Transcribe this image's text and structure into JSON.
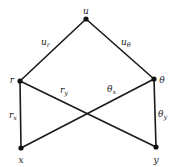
{
  "diagram": {
    "type": "dependency-tree",
    "nodes": [
      {
        "id": "u",
        "label": "u",
        "x": 86,
        "y": 19,
        "lx": 86,
        "ly": 11
      },
      {
        "id": "r",
        "label": "r",
        "x": 20,
        "y": 81,
        "lx": 12,
        "ly": 80
      },
      {
        "id": "theta",
        "label": "θ",
        "x": 154,
        "y": 79,
        "lx": 162,
        "ly": 80
      },
      {
        "id": "x",
        "label": "x",
        "x": 21,
        "y": 148,
        "lx": 21,
        "ly": 160
      },
      {
        "id": "y",
        "label": "y",
        "x": 156,
        "y": 147,
        "lx": 156,
        "ly": 160
      }
    ],
    "edges": [
      {
        "from": "u",
        "to": "r",
        "label_main": "u",
        "label_sub": "r",
        "lx": 41,
        "ly": 45
      },
      {
        "from": "u",
        "to": "theta",
        "label_main": "u",
        "label_sub": "θ",
        "lx": 121,
        "ly": 45
      },
      {
        "from": "r",
        "to": "x",
        "label_main": "r",
        "label_sub": "x",
        "lx": 9,
        "ly": 118
      },
      {
        "from": "r",
        "to": "y",
        "label_main": "r",
        "label_sub": "y",
        "lx": 60,
        "ly": 93
      },
      {
        "from": "theta",
        "to": "x",
        "label_main": "θ",
        "label_sub": "x",
        "lx": 107,
        "ly": 92
      },
      {
        "from": "theta",
        "to": "y",
        "label_main": "θ",
        "label_sub": "y",
        "lx": 158,
        "ly": 117
      }
    ]
  }
}
